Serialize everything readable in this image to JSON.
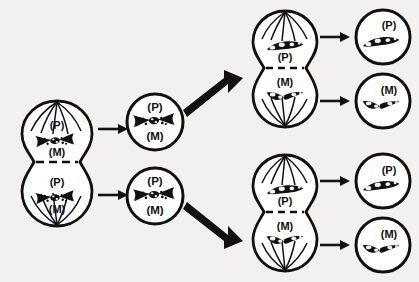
{
  "diagram": {
    "background_color": "#f2f1ef",
    "ink_color": "#111111",
    "labels": {
      "paternal": "(P)",
      "maternal": "(M)"
    },
    "columns": [
      {
        "name": "stage-1-parent-cell",
        "kind": "dividing-cell",
        "count": 1,
        "cells": [
          {
            "name": "parent-cell",
            "halves": [
              {
                "name": "upper-half",
                "labels": [
                  "(P)",
                  "(M)"
                ],
                "chromosome": "paired-bowtie"
              },
              {
                "name": "lower-half",
                "labels": [
                  "(P)",
                  "(M)"
                ],
                "chromosome": "paired-bowtie"
              }
            ]
          }
        ]
      },
      {
        "name": "stage-2-daughter-cells",
        "kind": "round-cell",
        "count": 2,
        "cells": [
          {
            "name": "daughter-cell-top",
            "labels": [
              "(P)",
              "(M)"
            ],
            "chromosome": "paired-bowtie"
          },
          {
            "name": "daughter-cell-bottom",
            "labels": [
              "(P)",
              "(M)"
            ],
            "chromosome": "paired-bowtie"
          }
        ]
      },
      {
        "name": "stage-3-second-division",
        "kind": "dividing-cell",
        "count": 2,
        "cells": [
          {
            "name": "dividing-cell-top",
            "halves": [
              {
                "name": "upper-half",
                "labels": [
                  "(P)"
                ],
                "chromosome": "single-rod"
              },
              {
                "name": "lower-half",
                "labels": [
                  "(M)"
                ],
                "chromosome": "single-bent-rod"
              }
            ]
          },
          {
            "name": "dividing-cell-bottom",
            "halves": [
              {
                "name": "upper-half",
                "labels": [
                  "(P)"
                ],
                "chromosome": "single-rod"
              },
              {
                "name": "lower-half",
                "labels": [
                  "(M)"
                ],
                "chromosome": "single-bent-rod"
              }
            ]
          }
        ]
      },
      {
        "name": "stage-4-gametes",
        "kind": "round-cell",
        "count": 4,
        "cells": [
          {
            "name": "gamete-1",
            "labels": [
              "(P)"
            ],
            "chromosome": "single-rod"
          },
          {
            "name": "gamete-2",
            "labels": [
              "(M)"
            ],
            "chromosome": "single-bent-rod"
          },
          {
            "name": "gamete-3",
            "labels": [
              "(P)"
            ],
            "chromosome": "single-rod"
          },
          {
            "name": "gamete-4",
            "labels": [
              "(M)"
            ],
            "chromosome": "single-bent-rod"
          }
        ]
      }
    ],
    "arrows": [
      {
        "name": "arrow-parent-to-daughter-top",
        "style": "thin"
      },
      {
        "name": "arrow-parent-to-daughter-bottom",
        "style": "thin"
      },
      {
        "name": "arrow-daughter-top-to-division-top",
        "style": "thick"
      },
      {
        "name": "arrow-daughter-bottom-to-division-bottom",
        "style": "thick"
      },
      {
        "name": "arrow-division-top-to-gamete-1",
        "style": "thin"
      },
      {
        "name": "arrow-division-top-to-gamete-2",
        "style": "thin"
      },
      {
        "name": "arrow-division-bottom-to-gamete-3",
        "style": "thin"
      },
      {
        "name": "arrow-division-bottom-to-gamete-4",
        "style": "thin"
      }
    ]
  }
}
